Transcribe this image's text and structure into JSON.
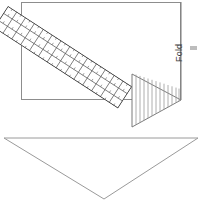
{
  "diagram": {
    "labels": {
      "fold": "Fold"
    },
    "colors": {
      "stroke": "#6e6e6e",
      "thin_stroke": "#9a9a9a",
      "ruler_stroke": "#4a4a4a",
      "hatch_stroke": "#8a8a8a",
      "background": "#ffffff",
      "text": "#3a3a3a",
      "edge_mark": "#bdbdbd"
    },
    "shapes": {
      "fabric_rectangle": {
        "name": "fabric-rectangle",
        "x": 21,
        "y": 2,
        "width": 160,
        "height": 98
      },
      "hatched_triangle": {
        "name": "hatched-triangle",
        "points": "132,74 132,127 181,100",
        "hatch_count": 12,
        "hatch_direction": "vertical"
      },
      "ruler": {
        "name": "ruler-overlay",
        "angle_deg": 33,
        "rows": 3,
        "columns": 14,
        "start": [
          10,
          10
        ],
        "end": [
          133,
          98
        ]
      },
      "lower_triangle": {
        "name": "lower-triangle",
        "points": "4,138 198,138 104,199"
      },
      "fold_line": {
        "name": "fold-line",
        "x1": 181,
        "y1": 2,
        "x2": 181,
        "y2": 100
      },
      "edge_mark": {
        "name": "right-edge-mark",
        "x": 190,
        "y": 46,
        "width": 7,
        "height": 4
      }
    }
  }
}
